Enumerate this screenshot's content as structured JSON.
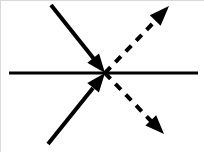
{
  "diagram": {
    "canvas": {
      "width": 204,
      "height": 152
    },
    "colors": {
      "stroke": "#000000",
      "background": "#ffffff",
      "border": "#d9d9d9"
    },
    "origin": {
      "x": 104,
      "y": 72
    },
    "baseline": {
      "label": "horizontal-boundary-line",
      "x1": 8,
      "y1": 72,
      "x2": 197,
      "y2": 72,
      "style": "solid",
      "width": 3.2
    },
    "dash_pattern": "8 7",
    "stroke_width": 4,
    "arrows": [
      {
        "id": "incoming-upper-left",
        "label": "Incoming arrow from upper left",
        "style": "solid",
        "direction": "toward-origin",
        "tail": {
          "x": 50,
          "y": 4
        },
        "tip": {
          "x": 104,
          "y": 72
        },
        "shaft_end": {
          "x": 93,
          "y": 58
        },
        "head_length": 19,
        "head_width": 15
      },
      {
        "id": "incoming-lower-left",
        "label": "Incoming arrow from lower left",
        "style": "solid",
        "direction": "toward-origin",
        "tail": {
          "x": 47,
          "y": 143
        },
        "tip": {
          "x": 104,
          "y": 72
        },
        "shaft_end": {
          "x": 92,
          "y": 87
        },
        "head_length": 19,
        "head_width": 15
      },
      {
        "id": "outgoing-upper-right",
        "label": "Outgoing dashed arrow to upper right",
        "style": "dashed",
        "direction": "away-from-origin",
        "tail": {
          "x": 104,
          "y": 72
        },
        "tip": {
          "x": 168,
          "y": 5
        },
        "shaft_end": {
          "x": 155,
          "y": 19
        },
        "head_length": 20,
        "head_width": 15
      },
      {
        "id": "outgoing-lower-right",
        "label": "Outgoing dashed arrow to lower right",
        "style": "dashed",
        "direction": "away-from-origin",
        "tail": {
          "x": 104,
          "y": 72
        },
        "tip": {
          "x": 163,
          "y": 133
        },
        "shaft_end": {
          "x": 150,
          "y": 120
        },
        "head_length": 19,
        "head_width": 15
      }
    ]
  }
}
